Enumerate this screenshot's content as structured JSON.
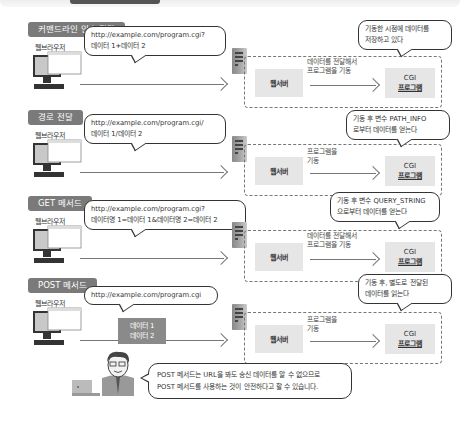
{
  "sections": [
    {
      "tag": "커맨드라인 인수 전달",
      "browser_label": "웹브라우저",
      "request_lines": [
        "http://example.com/program.cgi?",
        "데이터 1+데이터 2"
      ],
      "web_server": "웹서버",
      "mid_lines": [
        "데이터를 전달해서",
        "프로그램을 기동"
      ],
      "cgi_lines": [
        "CGI",
        "프로그램"
      ],
      "cgi_note_lines": [
        "기동한 시점에 데이터를",
        "저장하고 있다"
      ]
    },
    {
      "tag": "경로 전달",
      "browser_label": "웹브라우저",
      "request_lines": [
        "http://example.com/program.cgi/",
        "데이터 1/데이터 2"
      ],
      "web_server": "웹서버",
      "mid_lines": [
        "프로그램을",
        "기동"
      ],
      "cgi_lines": [
        "CGI",
        "프로그램"
      ],
      "cgi_note_lines": [
        "기동 후 변수 PATH_INFO",
        "로부터 데이터를 얻는다"
      ]
    },
    {
      "tag": "GET 메서드",
      "browser_label": "웹브라우저",
      "request_lines": [
        "http://example.com/program.cgi?",
        "데이터명 1=데이터 1&데이터명 2=데이터 2"
      ],
      "web_server": "웹서버",
      "mid_lines": [
        "데이터를 전달해서",
        "프로그램을 기동"
      ],
      "cgi_lines": [
        "CGI",
        "프로그램"
      ],
      "cgi_note_lines": [
        "기동 후 변수 QUERY_STRING",
        "으로부터 데이터를 얻는다"
      ]
    },
    {
      "tag": "POST 메서드",
      "browser_label": "웹브라우저",
      "request_lines": [
        "http://example.com/program.cgi"
      ],
      "data_block_lines": [
        "데이터 1",
        "데이터 2"
      ],
      "web_server": "웹서버",
      "mid_lines": [
        "프로그램을",
        "기동"
      ],
      "cgi_lines": [
        "CGI",
        "프로그램"
      ],
      "cgi_note_lines": [
        "기동 후, 별도로 전달된",
        "데이터를 읽는다"
      ]
    }
  ],
  "footer_note_lines": [
    "POST 메서드는 URL을 봐도 송신 데이터를 알 수 없으므로",
    "POST 메서드를 사용하는 것이 안전하다고 할 수 있습니다."
  ]
}
